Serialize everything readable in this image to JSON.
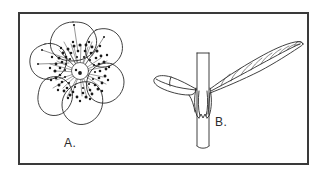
{
  "figure": {
    "background_color": "#ffffff",
    "border_color": "#3a3a3a",
    "ink_color": "#2b2b2b",
    "stamen_color": "#1a1a1a",
    "width": 329,
    "height": 177,
    "panels": [
      {
        "id": "panel-a",
        "label": "A.",
        "subject": "flower-face-view",
        "description": "Radially symmetric flower seen face-on with six broad overlapping rounded petals surrounding a dense ring of stamens and a pale central pistil region.",
        "petal_count": 6,
        "center_structure": "dense stamen ring with pale central carpel",
        "label_position": {
          "x": 64,
          "y": 136
        }
      },
      {
        "id": "panel-b",
        "label": "B.",
        "subject": "stem-with-opposite-leaves",
        "description": "Upright stem segment bearing a pair of opposite leaves at a single node: a small folded leaf on the left and a long lanceolate leaf with pinnate venation on the right, both with sheathing bases curving down the stem.",
        "leaf_count": 2,
        "leaf_left": "small folded leaf, pointed tip",
        "leaf_right": "long lanceolate leaf, pinnate venation, acuminate tip",
        "vein_count_right_leaf": 9,
        "label_position": {
          "x": 215,
          "y": 115
        }
      }
    ]
  }
}
